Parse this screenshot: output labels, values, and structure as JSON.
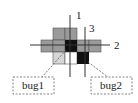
{
  "diagram": {
    "lines": [
      {
        "id": "1",
        "label": "1",
        "orientation": "vertical"
      },
      {
        "id": "2",
        "label": "2",
        "orientation": "horizontal"
      },
      {
        "id": "3",
        "label": "3",
        "orientation": "vertical"
      }
    ],
    "bugs": [
      {
        "id": "bug1",
        "label": "bug1"
      },
      {
        "id": "bug2",
        "label": "bug2"
      }
    ],
    "colors": {
      "gray_cell": "#9a9a9a",
      "light_cell": "#d6d6d6",
      "bug_cell": "#111111",
      "line": "#333333",
      "dashed_box": "#666666"
    }
  }
}
